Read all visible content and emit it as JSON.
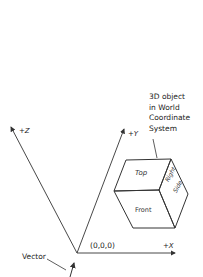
{
  "diagram": {
    "title_note": [
      "3D object",
      "in World",
      "Coordinate",
      "System"
    ],
    "axes": {
      "z_label": "+Z",
      "y_label": "+Y",
      "x_label": "+X",
      "origin_label": "(0,0,0)"
    },
    "cube_faces": {
      "top": "Top",
      "front": "Front",
      "right_line1": "Right",
      "right_line2": "Side"
    },
    "vector_label": "Vector",
    "colors": {
      "line": "#333333",
      "background": "#ffffff"
    }
  }
}
